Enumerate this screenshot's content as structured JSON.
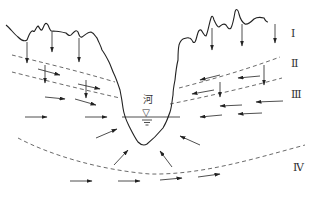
{
  "diagram": {
    "river_label": "河",
    "zones": [
      {
        "id": "I",
        "label": "Ⅰ",
        "x": 291,
        "y": 37
      },
      {
        "id": "II",
        "label": "Ⅱ",
        "x": 291,
        "y": 67
      },
      {
        "id": "III",
        "label": "Ⅲ",
        "x": 291,
        "y": 97
      },
      {
        "id": "IV",
        "label": "Ⅳ",
        "x": 293,
        "y": 170
      }
    ],
    "colors": {
      "line": "#222222",
      "dashed": "#444444",
      "background": "#ffffff"
    },
    "water_symbol": "▽"
  }
}
